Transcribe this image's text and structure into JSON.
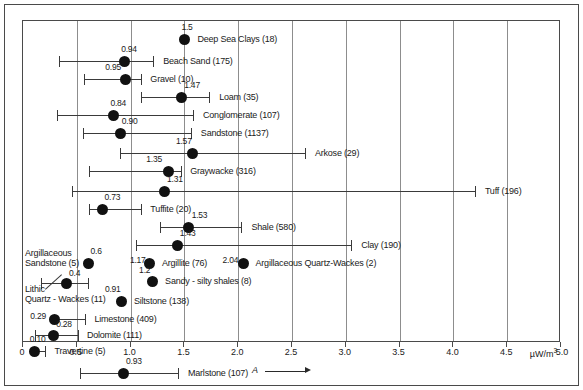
{
  "chart_data": {
    "type": "scatter",
    "title": "",
    "xlabel": "A",
    "ylabel": "",
    "unit": "µW/m",
    "unit_exponent": "3",
    "xlim": [
      0,
      5.0
    ],
    "grid": true,
    "legend": "none",
    "tick_labels": [
      "0",
      "0.5",
      "1.0",
      "1.5",
      "2.0",
      "2.5",
      "3.0",
      "3.5",
      "4.0",
      "4.5",
      "5.0"
    ],
    "tick_values": [
      0,
      0.5,
      1.0,
      1.5,
      2.0,
      2.5,
      3.0,
      3.5,
      4.0,
      4.5,
      5.0
    ],
    "value_label_note": "mean heat production value printed above each dot",
    "points": [
      {
        "label": "Deep Sea Clays (18)",
        "n": 18,
        "mean": 1.5,
        "mean_text": "1.5",
        "low": null,
        "high": null
      },
      {
        "label": "Beach Sand (175)",
        "n": 175,
        "mean": 0.94,
        "mean_text": "0.94",
        "low": 0.33,
        "high": 1.21
      },
      {
        "label": "Gravel (10)",
        "n": 10,
        "mean": 0.95,
        "mean_text": "0.95",
        "low": 0.57,
        "high": 1.1
      },
      {
        "label": "Loam (35)",
        "n": 35,
        "mean": 1.47,
        "mean_text": "1.47",
        "low": 1.1,
        "high": 1.73
      },
      {
        "label": "Conglomerate (107)",
        "n": 107,
        "mean": 0.84,
        "mean_text": "0.84",
        "low": 0.32,
        "high": 1.58
      },
      {
        "label": "Sandstone (1137)",
        "n": 1137,
        "mean": 0.9,
        "mean_text": "0.90",
        "low": 0.56,
        "high": 1.56
      },
      {
        "label": "Arkose (29)",
        "n": 29,
        "mean": 1.57,
        "mean_text": "1.57",
        "low": 0.9,
        "high": 2.62
      },
      {
        "label": "Graywacke (316)",
        "n": 316,
        "mean": 1.35,
        "mean_text": "1.35",
        "low": 0.61,
        "high": 1.47
      },
      {
        "label": "Tuff (196)",
        "n": 196,
        "mean": 1.31,
        "mean_text": "1.31",
        "low": 0.46,
        "high": 4.2
      },
      {
        "label": "Tuffite (20)",
        "n": 20,
        "mean": 0.73,
        "mean_text": "0.73",
        "low": 0.61,
        "high": 1.1
      },
      {
        "label": "Shale (580)",
        "n": 580,
        "mean": 1.53,
        "mean_text": "1.53",
        "low": 1.27,
        "high": 2.03
      },
      {
        "label": "Clay (190)",
        "n": 190,
        "mean": 1.43,
        "mean_text": "1.43",
        "low": 1.05,
        "high": 3.05
      },
      {
        "label": "Argillaceous Sandstone (5)",
        "n": 5,
        "mean": 0.6,
        "mean_text": "0.6",
        "low": null,
        "high": null
      },
      {
        "label": "Argillite (76)",
        "n": 76,
        "mean": 1.17,
        "mean_text": "1.17",
        "low": null,
        "high": null
      },
      {
        "label": "Argillaceous Quartz-Wackes (2)",
        "n": 2,
        "mean": 2.04,
        "mean_text": "2.04",
        "low": null,
        "high": null
      },
      {
        "label": "Lithic Quartz-Wackes (11)",
        "n": 11,
        "mean": 0.4,
        "mean_text": "0.4",
        "low": 0.17,
        "high": 0.6
      },
      {
        "label": "Sandy - silty shales (8)",
        "n": 8,
        "mean": 1.2,
        "mean_text": "1.2",
        "low": null,
        "high": null
      },
      {
        "label": "Siltstone (138)",
        "n": 138,
        "mean": 0.91,
        "mean_text": "0.91",
        "low": null,
        "high": null
      },
      {
        "label": "Limestone (409)",
        "n": 409,
        "mean": 0.29,
        "mean_text": "0.29",
        "low": null,
        "high": 0.58
      },
      {
        "label": "Dolomite (111)",
        "n": 111,
        "mean": 0.28,
        "mean_text": "0.28",
        "low": 0.11,
        "high": 0.51
      },
      {
        "label": "Travertine (5)",
        "n": 5,
        "mean": 0.1,
        "mean_text": "0.10",
        "low": null,
        "high": 0.2
      },
      {
        "label": "Marlstone (107)",
        "n": 107,
        "mean": 0.93,
        "mean_text": "0.93",
        "low": 0.53,
        "high": 1.44
      }
    ]
  },
  "axis": {
    "unit_label": "µW/m",
    "unit_sup": "3",
    "title_glyph": "A"
  },
  "multiline_labels": {
    "argillaceous_sandstone": [
      "Argillaceous",
      "Sandstone (5)"
    ],
    "lithic_quartz_wackes": [
      "Lithic",
      "Quartz - Wackes (11)"
    ]
  }
}
